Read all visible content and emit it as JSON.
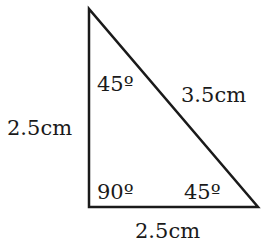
{
  "diagram": {
    "type": "right-triangle",
    "vertices": {
      "top": [
        89,
        9
      ],
      "bottom_left": [
        89,
        207
      ],
      "bottom_right": [
        258,
        207
      ]
    },
    "stroke_color": "#1a1a1a",
    "sides": {
      "vertical": "2.5cm",
      "horizontal": "2.5cm",
      "hypotenuse": "3.5cm"
    },
    "angles": {
      "top": "45º",
      "bottom_left": "90º",
      "bottom_right": "45º"
    }
  }
}
